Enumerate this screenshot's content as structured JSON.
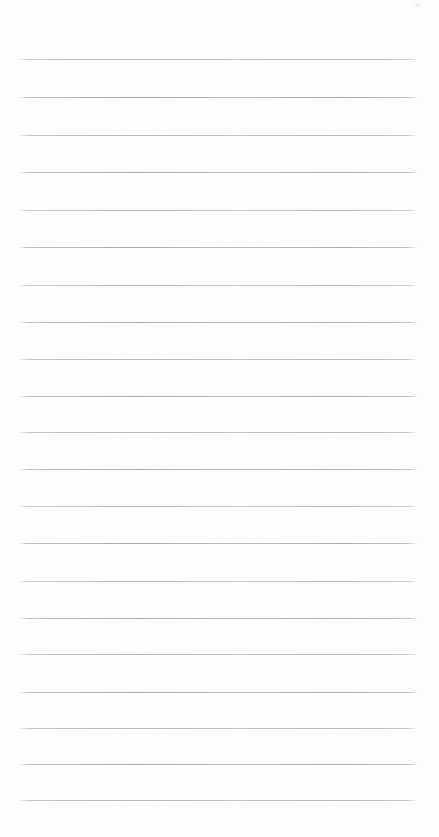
{
  "page": {
    "background_color": "#fdfdfd",
    "width_px": 439,
    "height_px": 837,
    "content_text": ""
  },
  "ruling": {
    "line_color": "#b3b3b3",
    "line_count": 21,
    "left_margin_px": 18,
    "line_length_px": 400,
    "first_line_y_px": 59,
    "line_spacing_px": 37,
    "line_y_positions": [
      59,
      97,
      135,
      172,
      210,
      247,
      285,
      322,
      359,
      396,
      432,
      469,
      506,
      543,
      581,
      618,
      654,
      692,
      728,
      764,
      800
    ]
  },
  "artifacts": {
    "speck": {
      "x": 415,
      "y": 3
    }
  }
}
